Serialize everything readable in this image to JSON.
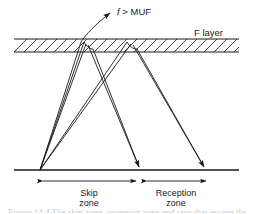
{
  "figure": {
    "type": "ray-path-diagram",
    "background_color": "#ffffff",
    "line_color": "#1a1a1a"
  },
  "labels": {
    "escaping_ray": {
      "symbol": "f",
      "relation": " > ",
      "limit": "MUF",
      "full_text": "f > MUF"
    },
    "layer": "F layer",
    "skip_zone_line1": "Skip",
    "skip_zone_line2": "zone",
    "reception_zone_line1": "Reception",
    "reception_zone_line2": "zone"
  },
  "geometry": {
    "ionosphere_band": {
      "x_start": 14,
      "x_end": 239,
      "y_top": 39,
      "y_bottom": 52,
      "hatch_pattern": "diagonal",
      "hatch_count": 22
    },
    "ground_line": {
      "x_start": 14,
      "x_end": 239,
      "y": 170
    },
    "transmitter": {
      "x": 40,
      "y": 170
    },
    "reflection_points": [
      {
        "x": 82,
        "y": 41
      },
      {
        "x": 88,
        "y": 42
      },
      {
        "x": 126,
        "y": 41
      },
      {
        "x": 133,
        "y": 42
      }
    ],
    "ground_arrivals": [
      {
        "x": 140,
        "y": 170
      },
      {
        "x": 205,
        "y": 170
      }
    ],
    "escape_arrow_tip": {
      "x": 113,
      "y": 11
    },
    "dimension_line_y": 181,
    "skip_zone": {
      "x_start": 40,
      "x_end": 138
    },
    "reception_zone": {
      "x_start": 144,
      "x_end": 208
    }
  },
  "caption_sliver": {
    "text": "Figure 14.4  The skip zone, reception zone and rays that escape the ionosphere"
  }
}
